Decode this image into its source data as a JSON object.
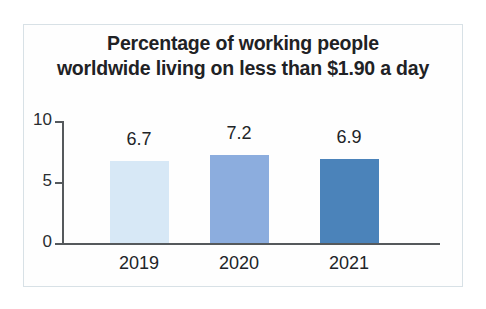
{
  "chart_data": {
    "type": "bar",
    "title": "Percentage of working people worldwide living on less than $1.90 a day",
    "title_line1": "Percentage of working people",
    "title_line2": "worldwide living on less than $1.90 a day",
    "categories": [
      "2019",
      "2020",
      "2021"
    ],
    "values": [
      6.7,
      7.2,
      6.9
    ],
    "value_labels": [
      "6.7",
      "7.2",
      "6.9"
    ],
    "xlabel": "",
    "ylabel": "",
    "ylim": [
      0,
      10
    ],
    "y_ticks": [
      "0",
      "5",
      "10"
    ],
    "grid": false,
    "legend": false,
    "bar_colors": [
      "#d7e8f6",
      "#8cadde",
      "#4b83ba"
    ],
    "axis_color": "#55595c",
    "text_color": "#212427",
    "frame_color": "#d8e1e6",
    "background": "#ffffff"
  },
  "axis": {
    "y_tick_10": "10",
    "y_tick_5": "5",
    "y_tick_0": "0"
  },
  "bars": [
    {
      "category": "2019",
      "value_label": "6.7"
    },
    {
      "category": "2020",
      "value_label": "7.2"
    },
    {
      "category": "2021",
      "value_label": "6.9"
    }
  ]
}
